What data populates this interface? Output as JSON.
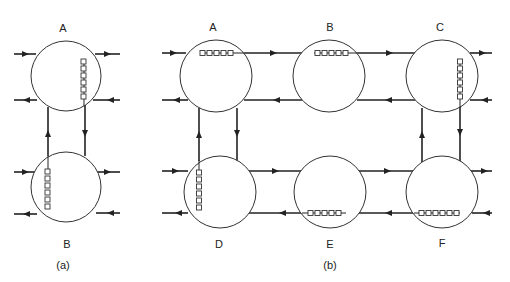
{
  "figure": {
    "subfigures": [
      {
        "caption": "(a)",
        "nodes": [
          {
            "id": "A",
            "label": "A",
            "cx": 66,
            "cy": 76,
            "r": 35,
            "label_x": 63,
            "label_y": 32,
            "queue": {
              "orientation": "vertical",
              "x": 83,
              "y0": 59,
              "count": 6
            }
          },
          {
            "id": "B",
            "label": "B",
            "cx": 66,
            "cy": 187,
            "r": 35,
            "label_x": 67,
            "label_y": 247,
            "queue": {
              "orientation": "vertical",
              "x": 47,
              "y0": 168,
              "count": 6
            }
          }
        ]
      },
      {
        "caption": "(b)",
        "nodes": [
          {
            "id": "A",
            "label": "A",
            "cx": 216,
            "cy": 76,
            "r": 36,
            "label_x": 213,
            "label_y": 31,
            "queue": {
              "orientation": "horizontal",
              "x0": 201,
              "y": 53,
              "count": 5
            }
          },
          {
            "id": "B",
            "label": "B",
            "cx": 329,
            "cy": 76,
            "r": 36,
            "label_x": 330,
            "label_y": 31,
            "queue": {
              "orientation": "horizontal",
              "x0": 315,
              "y": 53,
              "count": 5
            }
          },
          {
            "id": "C",
            "label": "C",
            "cx": 442,
            "cy": 76,
            "r": 36,
            "label_x": 440,
            "label_y": 31,
            "queue": {
              "orientation": "vertical",
              "x": 459,
              "y0": 61,
              "count": 6
            }
          },
          {
            "id": "D",
            "label": "D",
            "cx": 220,
            "cy": 192,
            "r": 36,
            "label_x": 219,
            "label_y": 248,
            "queue": {
              "orientation": "vertical",
              "x": 199,
              "y0": 171,
              "count": 6
            }
          },
          {
            "id": "E",
            "label": "E",
            "cx": 330,
            "cy": 192,
            "r": 36,
            "label_x": 330,
            "label_y": 248,
            "queue": {
              "orientation": "horizontal",
              "x0": 310,
              "y": 213,
              "count": 5
            }
          },
          {
            "id": "F",
            "label": "F",
            "cx": 442,
            "cy": 192,
            "r": 36,
            "label_x": 442,
            "label_y": 247,
            "queue": {
              "orientation": "horizontal",
              "x0": 420,
              "y": 213,
              "count": 6
            }
          }
        ]
      }
    ],
    "captions": {
      "a": "(a)",
      "b": "(b)"
    },
    "labels": {
      "a_A": "A",
      "a_B": "B",
      "b_A": "A",
      "b_B": "B",
      "b_C": "C",
      "b_D": "D",
      "b_E": "E",
      "b_F": "F"
    }
  }
}
